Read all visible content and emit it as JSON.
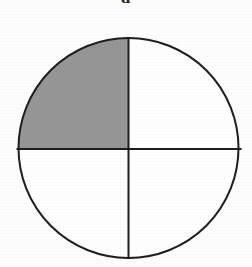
{
  "figure": {
    "label": "a",
    "label_clipped_at_top": true,
    "caption": ""
  },
  "chart_data": {
    "type": "pie",
    "title": "a",
    "subtitle": "",
    "xlabel": "",
    "ylabel": "",
    "legend_position": "none",
    "grid": false,
    "categories": [
      "upper-left quadrant",
      "upper-right quadrant",
      "lower-right quadrant",
      "lower-left quadrant"
    ],
    "values": [
      25,
      25,
      25,
      25
    ],
    "shaded": [
      true,
      false,
      false,
      false
    ],
    "shaded_fraction": "1/4",
    "shaded_count": 1,
    "total_parts": 4,
    "slice_colors": [
      "#969696",
      "#ffffff",
      "#ffffff",
      "#ffffff"
    ],
    "annotations": []
  },
  "geometry": {
    "canvas_width": 252,
    "canvas_height": 267,
    "center_x": 128.5,
    "center_y": 148,
    "radius": 111,
    "stroke_width": 2,
    "vertical_divider_angle_deg": 90,
    "horizontal_divider_angle_deg": 0
  },
  "colors": {
    "background": "#fdfdfd",
    "outline": "#1e1e1e",
    "shaded_fill": "#969696",
    "unshaded_fill": "#ffffff",
    "divider": "#1e1e1e",
    "label_text": "#2b2b2b"
  },
  "parts": {
    "circle_outline_name": "circle-outline",
    "vertical_divider_name": "vertical-divider",
    "horizontal_divider_name": "horizontal-divider",
    "shaded_quadrant_name": "shaded-quadrant-upper-left",
    "quadrant_ur_name": "quadrant-upper-right",
    "quadrant_lr_name": "quadrant-lower-right",
    "quadrant_ll_name": "quadrant-lower-left"
  }
}
